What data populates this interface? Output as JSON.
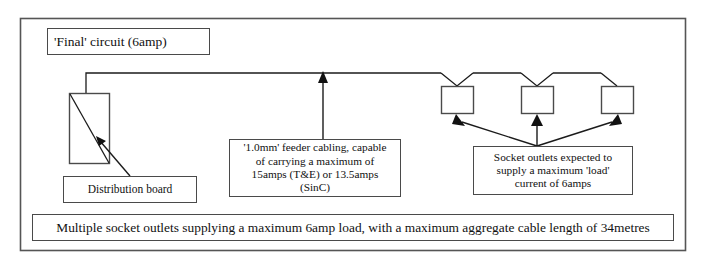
{
  "diagram": {
    "title_box": {
      "text": "'Final' circuit (6amp)"
    },
    "distribution_board": {
      "label": "Distribution board",
      "symbol_name": "distribution-board-symbol"
    },
    "feeder_cable_note": {
      "line1": "'1.0mm' feeder cabling, capable",
      "line2": "of carrying a maximum of",
      "line3": "15amps (T&E) or 13.5amps",
      "line4": "(SinC)"
    },
    "socket_load_note": {
      "line1": "Socket outlets expected to",
      "line2": "supply a maximum 'load'",
      "line3": "current of 6amps"
    },
    "summary_banner": {
      "text": "Multiple socket outlets supplying a maximum 6amp load, with a maximum aggregate cable length of 34metres"
    },
    "sockets": [
      {
        "name": "socket-outlet-1"
      },
      {
        "name": "socket-outlet-2"
      },
      {
        "name": "socket-outlet-3"
      }
    ],
    "colors": {
      "wire": "#1b1b1b",
      "box_border": "#4a4a4a",
      "frame": "#555555",
      "background": "#ffffff",
      "text": "#111111"
    }
  }
}
